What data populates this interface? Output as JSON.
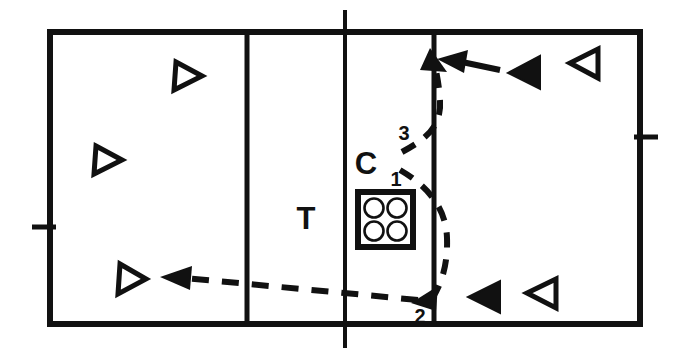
{
  "diagram": {
    "type": "court-tactic-diagram",
    "colors": {
      "line": "#111111",
      "background": "#ffffff",
      "fill_marker": "#111111"
    },
    "labels": {
      "coach": "C",
      "target": "T",
      "path_1": "1",
      "path_2": "2",
      "path_3": "3"
    },
    "court": {
      "boundary": {
        "x": 50,
        "y": 32,
        "width": 590,
        "height": 292
      },
      "vertical_lines": [
        247,
        345,
        434
      ],
      "center_line_x": 345,
      "ticks": [
        {
          "side": "left",
          "x": 50,
          "y": 227
        },
        {
          "side": "right",
          "x": 640,
          "y": 137
        }
      ]
    },
    "ball_cart": {
      "label": "T",
      "ball_count": 4,
      "x": 358,
      "y": 192,
      "width": 55,
      "height": 55
    },
    "players": [
      {
        "id": "p1",
        "style": "outline",
        "direction": "right",
        "x": 184,
        "y": 77
      },
      {
        "id": "p2",
        "style": "outline",
        "direction": "right",
        "x": 104,
        "y": 160
      },
      {
        "id": "p3",
        "style": "outline",
        "direction": "right",
        "x": 128,
        "y": 280
      },
      {
        "id": "p4",
        "style": "filled",
        "direction": "left",
        "x": 522,
        "y": 72
      },
      {
        "id": "p5",
        "style": "outline",
        "direction": "left",
        "x": 584,
        "y": 63
      },
      {
        "id": "p6",
        "style": "filled",
        "direction": "left",
        "x": 482,
        "y": 297
      },
      {
        "id": "p7",
        "style": "outline",
        "direction": "left",
        "x": 540,
        "y": 293
      }
    ],
    "movements": [
      {
        "id": "m1",
        "label": "1",
        "style": "dashed",
        "description": "coach toss down the net"
      },
      {
        "id": "m2",
        "label": "2",
        "style": "dashed",
        "description": "dig path to back-left zone"
      },
      {
        "id": "m3",
        "label": "3",
        "style": "dashed",
        "description": "set path up the net"
      },
      {
        "id": "m4",
        "label": "",
        "style": "solid",
        "description": "attack approach from right back"
      }
    ]
  }
}
